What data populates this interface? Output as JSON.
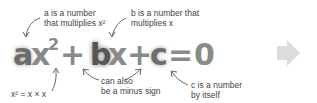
{
  "equation": {
    "a": "a",
    "x1": "x",
    "exp": "2",
    "plus1": "+",
    "b": "b",
    "x2": "x",
    "plus2": "+",
    "c": "c",
    "equals": "=",
    "zero": "0"
  },
  "annotations": {
    "a_note": {
      "line1": "a is a number",
      "line2": "that multiplies x²"
    },
    "b_note": {
      "line1": "b is a number that",
      "line2": "multiplies x"
    },
    "x2_note": "x² = x × x",
    "sign_note": {
      "line1": "can also",
      "line2": "be a minus sign"
    },
    "c_note": {
      "line1": "c is a number",
      "line2": "by itself"
    }
  },
  "icons": {
    "next_arrow": "right-arrow-icon"
  },
  "colors": {
    "equation_gray": "#8a8a8a",
    "variable_dark": "#555555",
    "annotation_text": "#444444",
    "arrow_light": "#dcdcdc"
  }
}
